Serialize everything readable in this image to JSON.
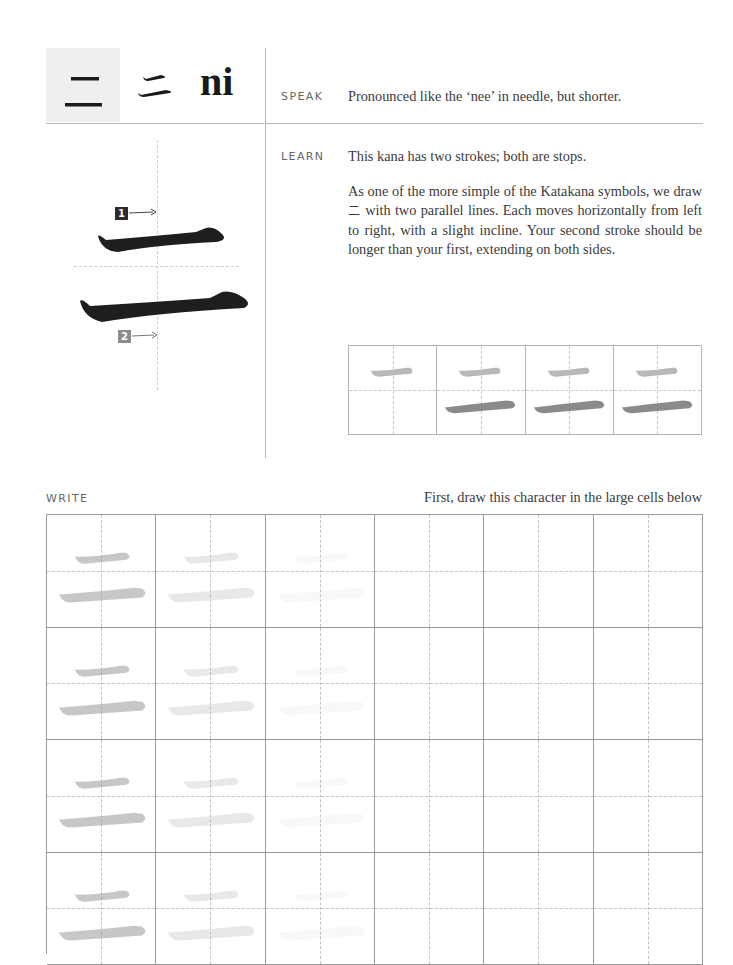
{
  "header": {
    "kana_glyph": "二",
    "kana_brush_glyph": "ニ",
    "romaji": "ni"
  },
  "speak": {
    "label": "SPEAK",
    "text": "Pronounced like the ‘nee’ in needle, but shorter."
  },
  "learn": {
    "label": "LEARN",
    "summary": "This kana has two strokes; both are stops.",
    "description_before": "As one of the more simple of the Katakana symbols, we draw ",
    "description_glyph": "二",
    "description_after": " with two parallel lines. Each moves horizontally from left to right, with a slight incline. Your second stroke should be longer than your first, extending on both sides."
  },
  "stroke_diagram": {
    "stroke_1_number": "1",
    "stroke_2_number": "2",
    "stroke_1_color": "#2b2b2b",
    "stroke_2_color": "#8c8c8c"
  },
  "stroke_order": {
    "cells": [
      {
        "strokes_shown": 1
      },
      {
        "strokes_shown": 2
      },
      {
        "strokes_shown": 2
      },
      {
        "strokes_shown": 2
      }
    ],
    "first_stroke_color": "#b8b8b8",
    "second_stroke_color": "#8a8a8a"
  },
  "write": {
    "label": "WRITE",
    "hint": "First, draw this character in the large cells below",
    "columns": 6,
    "rows": 4,
    "ghost_opacity_by_column": [
      0.55,
      0.22,
      0.06,
      0,
      0,
      0
    ]
  }
}
